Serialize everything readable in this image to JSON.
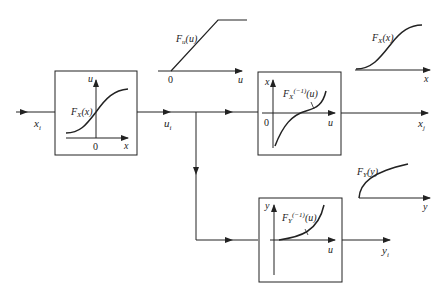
{
  "diagram": {
    "title": "",
    "input": {
      "label": "x",
      "sub": "i"
    },
    "intermediate": {
      "label": "u",
      "sub": "i"
    },
    "output_x": {
      "label": "x",
      "sub": "j"
    },
    "output_y": {
      "label": "y",
      "sub": "i"
    },
    "block_cdf": {
      "curve_label": "F",
      "curve_sub": "X",
      "curve_arg": "(x)",
      "axis_x": "x",
      "axis_y": "u",
      "origin": "0"
    },
    "block_inverse_x": {
      "curve_label": "F",
      "curve_sub": "X",
      "curve_sup": "(−1)",
      "curve_arg": "(u)",
      "axis_x": "u",
      "axis_y": "x",
      "origin": "0"
    },
    "block_inverse_y": {
      "curve_label": "F",
      "curve_sub": "Y",
      "curve_sup": "(−1)",
      "curve_arg": "(u)",
      "axis_x": "u",
      "axis_y": "y"
    },
    "uniform_cdf": {
      "curve_label": "F",
      "curve_sub": "u",
      "curve_arg": "(u)",
      "axis_x": "u",
      "origin": "0"
    },
    "target_cdf_x": {
      "curve_label": "F",
      "curve_sub": "X",
      "curve_arg": "(x)",
      "axis_x": "x"
    },
    "target_cdf_y": {
      "curve_label": "F",
      "curve_sub": "Y",
      "curve_arg": "(y)",
      "axis_x": "y"
    },
    "colors": {
      "stroke": "#222222",
      "background": "#ffffff"
    }
  }
}
